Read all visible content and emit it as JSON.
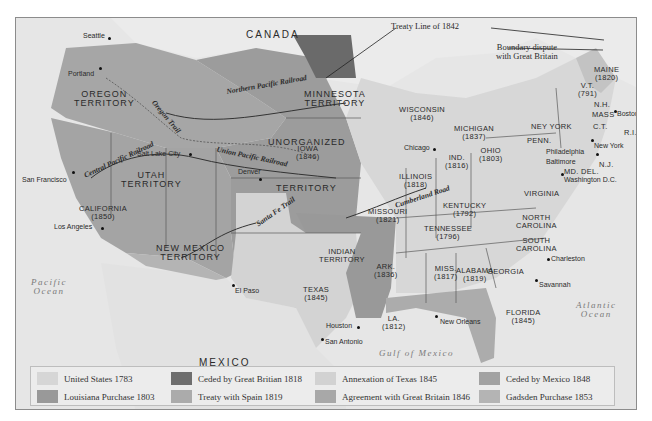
{
  "map": {
    "legend": [
      {
        "label": "United States 1783",
        "color": "#d6d6d6"
      },
      {
        "label": "Ceded by Great Britian 1818",
        "color": "#6e6e6e"
      },
      {
        "label": "Annexation of Texas 1845",
        "color": "#d2d2d2"
      },
      {
        "label": "Ceded by Mexico 1848",
        "color": "#a2a2a2"
      },
      {
        "label": "Louisiana Purchase 1803",
        "color": "#999999"
      },
      {
        "label": "Treaty with Spain 1819",
        "color": "#ababab"
      },
      {
        "label": "Agreement with Great Britain 1846",
        "color": "#a8a8a8"
      },
      {
        "label": "Gadsden Purchase 1853",
        "color": "#b4b4b4"
      }
    ],
    "countries": {
      "canada": "CANADA",
      "mexico": "MEXICO"
    },
    "water": {
      "pacific_1": "Pacific",
      "pacific_2": "Ocean",
      "atlantic_1": "Atlantic",
      "atlantic_2": "Ocean",
      "gulf": "Gulf of Mexico"
    },
    "annotations": {
      "treaty_line": "Treaty Line of 1842",
      "boundary_1": "Boundary dispute",
      "boundary_2": "with Great Britain"
    },
    "routes": {
      "northern_pacific": "Northern Pacific Railroad",
      "union_pacific": "Union Pacific Railroad",
      "central_pacific": "Central Pacific Railroad",
      "oregon_trail": "Oregon Trail",
      "santa_fe_trail": "Santa Fe Trail",
      "cumberland_road": "Cumberland Road"
    },
    "regions": {
      "oregon_1": "OREGON",
      "oregon_2": "TERRITORY",
      "minnesota_1": "MINNESOTA",
      "minnesota_2": "TERRITORY",
      "unorganized_1": "UNORGANIZED",
      "unorganized_2": "TERRITORY",
      "utah_1": "UTAH",
      "utah_2": "TERRITORY",
      "california_1": "CALIFORNIA",
      "california_2": "(1850)",
      "newmexico_1": "NEW MEXICO",
      "newmexico_2": "TERRITORY",
      "texas_1": "TEXAS",
      "texas_2": "(1845)",
      "indian_1": "INDIAN",
      "indian_2": "TERRITORY",
      "iowa_1": "IOWA",
      "iowa_2": "(1846)",
      "wisconsin_1": "WISCONSIN",
      "wisconsin_2": "(1846)",
      "missouri_1": "MISSOURI",
      "missouri_2": "(1821)",
      "ark_1": "ARK.",
      "ark_2": "(1836)",
      "la_1": "LA.",
      "la_2": "(1812)",
      "illinois_1": "ILLINOIS",
      "illinois_2": "(1818)",
      "ind_1": "IND.",
      "ind_2": "(1816)",
      "ohio_1": "OHIO",
      "ohio_2": "(1803)",
      "michigan_1": "MICHIGAN",
      "michigan_2": "(1837)",
      "kentucky_1": "KENTUCKY",
      "kentucky_2": "(1792)",
      "tennessee_1": "TENNESSEE",
      "tennessee_2": "(1796)",
      "miss_1": "MISS.",
      "miss_2": "(1817)",
      "alabama_1": "ALABAMA",
      "alabama_2": "(1819)",
      "georgia": "GEORGIA",
      "florida_1": "FLORIDA",
      "florida_2": "(1845)",
      "nc_1": "NORTH",
      "nc_2": "CAROLINA",
      "sc_1": "SOUTH",
      "sc_2": "CAROLINA",
      "virginia": "VIRGINIA",
      "penn": "PENN.",
      "newyork": "NEY YORK",
      "maine_1": "MAINE",
      "maine_2": "(1820)",
      "vt_1": "V.T.",
      "vt_2": "(791)",
      "nh": "N.H.",
      "mass": "MASS",
      "ct": "C.T.",
      "ri": "R.I.",
      "nj": "N.J.",
      "md_del": "MD. DEL."
    },
    "cities": {
      "seattle": "Seattle",
      "portland": "Portland",
      "san_francisco": "San Francisco",
      "los_angeles": "Los Angeles",
      "salt_lake_city": "Salt Lake City",
      "denver": "Denver",
      "el_paso": "El Paso",
      "houston": "Houston",
      "san_antonio": "San Antonio",
      "new_orleans": "New Orleans",
      "chicago": "Chicago",
      "philadelphia": "Philadelphia",
      "baltimore": "Baltimore",
      "washington": "Washington D.C.",
      "new_york": "New York",
      "boston": "Boston",
      "charleston": "Charleston",
      "savannah": "Savannah"
    }
  }
}
